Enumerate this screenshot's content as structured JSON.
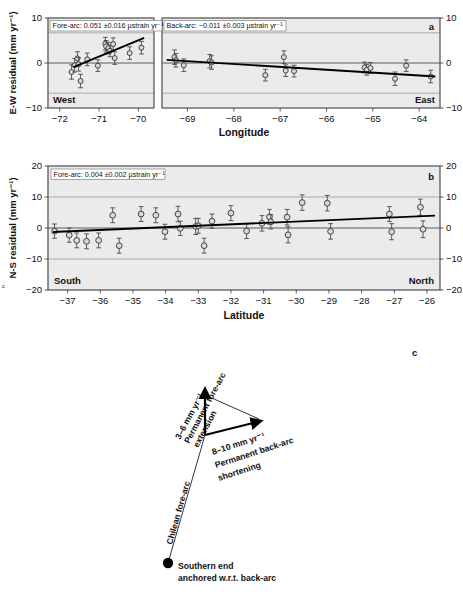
{
  "figure": {
    "panel_a_label": "a",
    "panel_b_label": "b",
    "panel_c_label": "c",
    "edge_mark": "c"
  },
  "chart_data": [
    {
      "id": "panel_a_forearc",
      "type": "scatter",
      "title": "",
      "panel_label": "a",
      "xlabel": "Longitude",
      "ylabel": "E-W residual (mm yr⁻¹)",
      "annotation": "Fore-arc: 0.051 ±0.016 µstrain yr⁻¹",
      "left_direction_label": "West",
      "xlim": [
        -72.3,
        -69.6
      ],
      "ylim": [
        -10,
        10
      ],
      "xticks": [
        -72,
        -71,
        -70
      ],
      "xticklabels": [
        "−72",
        "−71",
        "−70"
      ],
      "yticks": [
        -10,
        0,
        10
      ],
      "yticklabels": [
        "−10",
        "0",
        "10"
      ],
      "gridlines_y": [
        -6.7,
        6.7
      ],
      "grid": true,
      "legend": "none",
      "trend": {
        "x0": -71.65,
        "y0": -0.9,
        "x1": -69.85,
        "y1": 5.6
      },
      "points": [
        {
          "x": -71.7,
          "y": -2.0,
          "err": 1.6
        },
        {
          "x": -71.62,
          "y": -0.5,
          "err": 1.5
        },
        {
          "x": -71.55,
          "y": 1.0,
          "err": 1.5
        },
        {
          "x": -71.52,
          "y": -0.3,
          "err": 1.5
        },
        {
          "x": -71.47,
          "y": -4.0,
          "err": 1.5
        },
        {
          "x": -71.3,
          "y": 0.8,
          "err": 1.4
        },
        {
          "x": -71.03,
          "y": -0.6,
          "err": 1.3
        },
        {
          "x": -70.84,
          "y": 4.3,
          "err": 1.4
        },
        {
          "x": -70.82,
          "y": 3.7,
          "err": 1.3
        },
        {
          "x": -70.76,
          "y": 3.3,
          "err": 1.3
        },
        {
          "x": -70.72,
          "y": 2.7,
          "err": 1.3
        },
        {
          "x": -70.64,
          "y": 4.2,
          "err": 1.4
        },
        {
          "x": -70.6,
          "y": 1.1,
          "err": 1.4
        },
        {
          "x": -70.22,
          "y": 2.2,
          "err": 1.4
        },
        {
          "x": -69.92,
          "y": 3.4,
          "err": 1.4
        }
      ]
    },
    {
      "id": "panel_a_backarc",
      "type": "scatter",
      "panel_label": "a",
      "xlabel": "Longitude",
      "annotation": "Back-arc: −0.011 ±0.003 µstrain yr⁻¹",
      "right_direction_label": "East",
      "xlim": [
        -69.55,
        -63.55
      ],
      "ylim": [
        -10,
        10
      ],
      "xticks": [
        -69,
        -68,
        -67,
        -66,
        -65,
        -64
      ],
      "xticklabels": [
        "−69",
        "−68",
        "−67",
        "−66",
        "−65",
        "−64"
      ],
      "gridlines_y": [
        -6.7,
        6.7
      ],
      "grid": true,
      "trend": {
        "x0": -69.45,
        "y0": 0.7,
        "x1": -63.65,
        "y1": -3.0
      },
      "points": [
        {
          "x": -69.28,
          "y": 1.3,
          "err": 1.6
        },
        {
          "x": -69.25,
          "y": 0.6,
          "err": 1.5
        },
        {
          "x": -69.08,
          "y": -0.5,
          "err": 1.4
        },
        {
          "x": -68.52,
          "y": 0.4,
          "err": 1.5
        },
        {
          "x": -68.48,
          "y": 0.1,
          "err": 1.5
        },
        {
          "x": -67.32,
          "y": -2.7,
          "err": 1.3
        },
        {
          "x": -66.92,
          "y": 1.3,
          "err": 1.4
        },
        {
          "x": -66.88,
          "y": -1.7,
          "err": 1.3
        },
        {
          "x": -66.7,
          "y": -1.8,
          "err": 1.3
        },
        {
          "x": -65.18,
          "y": -1.0,
          "err": 1.2
        },
        {
          "x": -65.13,
          "y": -1.5,
          "err": 1.2
        },
        {
          "x": -65.05,
          "y": -1.1,
          "err": 1.2
        },
        {
          "x": -64.52,
          "y": -3.5,
          "err": 1.5
        },
        {
          "x": -64.28,
          "y": -0.6,
          "err": 1.3
        },
        {
          "x": -63.75,
          "y": -3.0,
          "err": 1.4
        }
      ]
    },
    {
      "id": "panel_b",
      "type": "scatter",
      "panel_label": "b",
      "xlabel": "Latitude",
      "ylabel": "N-S residual (mm yr⁻¹)",
      "annotation": "Fore-arc: 0.004 ±0.002 µstrain yr⁻¹",
      "left_direction_label": "South",
      "right_direction_label": "North",
      "xlim": [
        -37.6,
        -25.6
      ],
      "ylim": [
        -20,
        20
      ],
      "xticks": [
        -37,
        -36,
        -35,
        -34,
        -33,
        -32,
        -31,
        -30,
        -29,
        -28,
        -27,
        -26
      ],
      "xticklabels": [
        "−37",
        "−36",
        "−35",
        "−34",
        "−33",
        "−32",
        "−31",
        "−30",
        "−29",
        "−28",
        "−27",
        "−26"
      ],
      "yticks": [
        -20,
        -10,
        0,
        10,
        20
      ],
      "yticklabels": [
        "−20",
        "−10",
        "0",
        "10",
        "20"
      ],
      "gridlines_y": [
        -10,
        10
      ],
      "grid": true,
      "trend": {
        "x0": -37.45,
        "y0": -1.3,
        "x1": -25.75,
        "y1": 4.0
      },
      "points": [
        {
          "x": -37.4,
          "y": -1.0,
          "err": 2.3
        },
        {
          "x": -36.95,
          "y": -2.3,
          "err": 2.3
        },
        {
          "x": -36.72,
          "y": -4.0,
          "err": 2.4
        },
        {
          "x": -36.42,
          "y": -4.3,
          "err": 2.4
        },
        {
          "x": -36.05,
          "y": -4.0,
          "err": 2.4
        },
        {
          "x": -35.62,
          "y": 4.1,
          "err": 2.4
        },
        {
          "x": -35.42,
          "y": -5.7,
          "err": 2.4
        },
        {
          "x": -34.75,
          "y": 4.5,
          "err": 2.4
        },
        {
          "x": -34.3,
          "y": 4.1,
          "err": 2.4
        },
        {
          "x": -34.02,
          "y": -1.2,
          "err": 2.4
        },
        {
          "x": -33.62,
          "y": 4.5,
          "err": 2.5
        },
        {
          "x": -33.55,
          "y": -0.1,
          "err": 2.3
        },
        {
          "x": -33.08,
          "y": 0.5,
          "err": 2.6
        },
        {
          "x": -33.0,
          "y": 0.7,
          "err": 2.4
        },
        {
          "x": -32.82,
          "y": -5.7,
          "err": 2.4
        },
        {
          "x": -32.58,
          "y": 2.2,
          "err": 2.3
        },
        {
          "x": -32.0,
          "y": 4.8,
          "err": 2.4
        },
        {
          "x": -31.52,
          "y": -1.0,
          "err": 2.4
        },
        {
          "x": -31.05,
          "y": 1.5,
          "err": 2.5
        },
        {
          "x": -30.82,
          "y": 3.6,
          "err": 2.4
        },
        {
          "x": -30.78,
          "y": 2.0,
          "err": 2.3
        },
        {
          "x": -30.28,
          "y": 3.5,
          "err": 2.5
        },
        {
          "x": -30.25,
          "y": -2.2,
          "err": 2.6
        },
        {
          "x": -29.82,
          "y": 8.2,
          "err": 2.5
        },
        {
          "x": -29.05,
          "y": 8.0,
          "err": 2.5
        },
        {
          "x": -28.95,
          "y": -1.1,
          "err": 2.5
        },
        {
          "x": -27.15,
          "y": 4.5,
          "err": 2.4
        },
        {
          "x": -27.08,
          "y": -1.2,
          "err": 2.6
        },
        {
          "x": -26.2,
          "y": 6.7,
          "err": 2.6
        },
        {
          "x": -26.12,
          "y": -0.4,
          "err": 2.7
        }
      ]
    }
  ],
  "panel_c": {
    "label": "c",
    "forearc_line_label": "Chilean fore-arc",
    "extension_rate": "3–6 mm yr⁻¹",
    "extension_label_line1": "Permanent fore-arc",
    "extension_label_line2": "extension",
    "shortening_rate": "8–10 mm yr⁻¹",
    "shortening_label_line1": "Permanent back-arc",
    "shortening_label_line2": "shortening",
    "anchor_line1": "Southern end",
    "anchor_line2": "anchored w.r.t. back-arc"
  },
  "colors": {
    "plot_background": "#ebebeb",
    "marker_fill": "#d9d9d9",
    "line": "#000000",
    "grid": "#8e8e8e"
  }
}
